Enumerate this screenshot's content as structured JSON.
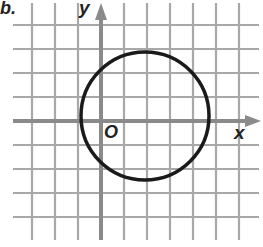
{
  "problem_label": "b.",
  "axes": {
    "x_label": "x",
    "y_label": "y",
    "origin_label": "O"
  },
  "grid": {
    "vertical_px": [
      32,
      55,
      78,
      101,
      124,
      147,
      170,
      193,
      216,
      239
    ],
    "horizontal_px": [
      25,
      49,
      73,
      97,
      121,
      145,
      169,
      193,
      217
    ],
    "x_extent_px": [
      13,
      259
    ],
    "y_extent_px": [
      3,
      240
    ],
    "y_axis_px": 101,
    "x_axis_px": 121,
    "unit_px": 23.3
  },
  "circle": {
    "cx_px": 145,
    "cy_px": 116,
    "r_px": 64
  },
  "colors": {
    "grid": "#a8a8a8",
    "axis": "#8a8a8a",
    "circle": "#1a1a1a",
    "text": "#222222"
  }
}
